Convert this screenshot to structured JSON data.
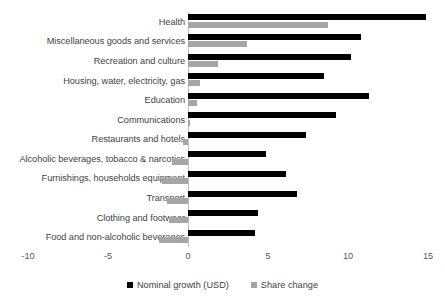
{
  "chart_data": {
    "type": "bar",
    "orientation": "horizontal",
    "title": "",
    "xlabel": "",
    "ylabel": "",
    "xlim": [
      -10,
      15
    ],
    "xticks": [
      -10,
      -5,
      0,
      5,
      10,
      15
    ],
    "xtick_labels": [
      "-10",
      "-5",
      "0",
      "5",
      "10",
      "15"
    ],
    "grid": false,
    "legend_position": "bottom",
    "categories": [
      "Health",
      "Miscellaneous goods and services",
      "Recreation and culture",
      "Housing, water, electricity, gas",
      "Education",
      "Communications",
      "Restaurants and hotels",
      "Alcoholic beverages, tobacco & narcotics",
      "Furnishings, households equipment",
      "Transport",
      "Clothing and footwear",
      "Food and non-alcoholic beverages"
    ],
    "series": [
      {
        "name": "Nominal growth (USD)",
        "color": "#000000",
        "values": [
          14.9,
          10.8,
          10.2,
          8.5,
          11.3,
          9.25,
          7.35,
          4.85,
          6.1,
          6.8,
          4.4,
          4.2
        ]
      },
      {
        "name": "Share change",
        "color": "#a6a6a6",
        "values": [
          8.75,
          3.7,
          1.9,
          0.75,
          0.55,
          0.15,
          -0.3,
          -1.0,
          -1.6,
          -1.3,
          -1.2,
          -1.8
        ]
      }
    ]
  },
  "legend": {
    "items": [
      {
        "label": "Nominal growth (USD)",
        "color": "#000000"
      },
      {
        "label": "Share change",
        "color": "#a6a6a6"
      }
    ]
  }
}
